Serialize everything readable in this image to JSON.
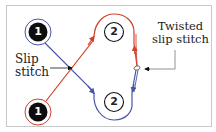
{
  "diagram": {
    "colors": {
      "frame": "#c9c9c9",
      "blue_yarn": "#4a55a8",
      "red_yarn": "#d2402c",
      "black_stitch": "#0d0d0d",
      "text": "#222222"
    },
    "nodes": [
      {
        "id": "top-1",
        "label": "1",
        "style": "filled-black",
        "ring": "blue",
        "cx": 38,
        "cy": 32
      },
      {
        "id": "bottom-1",
        "label": "1",
        "style": "filled-black",
        "ring": "red",
        "cx": 38,
        "cy": 112
      },
      {
        "id": "top-2",
        "label": "2",
        "style": "outline",
        "loop": "red",
        "cx": 114,
        "cy": 32
      },
      {
        "id": "bottom-2",
        "label": "2",
        "style": "outline",
        "loop": "blue",
        "cx": 114,
        "cy": 102
      }
    ],
    "edges": [
      {
        "from": "top-1",
        "to": "bottom-2",
        "color": "blue",
        "arrow": "down"
      },
      {
        "from": "bottom-1",
        "to": "top-2",
        "color": "red",
        "arrow": "up"
      },
      {
        "from": "top-2",
        "to": "twist",
        "color": "red",
        "arrow": "up",
        "side": "right"
      },
      {
        "from": "twist",
        "to": "bottom-2",
        "color": "blue",
        "arrow": "down",
        "side": "right"
      }
    ],
    "labels": {
      "slip_line1": "Slip",
      "slip_line2": "stitch",
      "twisted_line1": "Twisted",
      "twisted_line2": "slip stitch"
    },
    "node_labels": {
      "top_1": "1",
      "bottom_1": "1",
      "top_2": "2",
      "bottom_2": "2"
    }
  }
}
